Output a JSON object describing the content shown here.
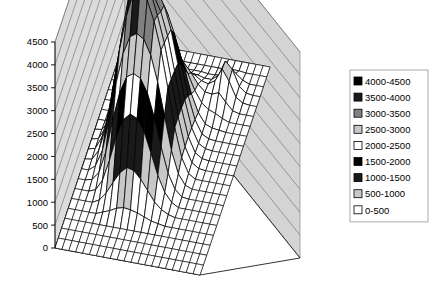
{
  "chart_data": {
    "type": "surface",
    "title": "",
    "xlabel": "",
    "ylabel": "",
    "zlabel": "",
    "zlim": [
      0,
      4500
    ],
    "ztick_labels": [
      "4500",
      "4000",
      "3500",
      "3000",
      "2500",
      "2000",
      "1500",
      "1000",
      "500",
      "0"
    ],
    "ztick_values": [
      4500,
      4000,
      3500,
      3000,
      2500,
      2000,
      1500,
      1000,
      500,
      0
    ],
    "grid": true,
    "legend_position": "right",
    "band_size": 500,
    "legend": [
      {
        "label": "4000-4500",
        "color": "#000000",
        "range": [
          4000,
          4500
        ]
      },
      {
        "label": "3500-4000",
        "color": "#1a1a1a",
        "range": [
          3500,
          4000
        ]
      },
      {
        "label": "3000-3500",
        "color": "#808080",
        "range": [
          3000,
          3500
        ]
      },
      {
        "label": "2500-3000",
        "color": "#c8c8c8",
        "range": [
          2500,
          3000
        ]
      },
      {
        "label": "2000-2500",
        "color": "#ffffff",
        "range": [
          2000,
          2500
        ]
      },
      {
        "label": "1500-2000",
        "color": "#000000",
        "range": [
          1500,
          2000
        ]
      },
      {
        "label": "1000-1500",
        "color": "#1a1a1a",
        "range": [
          1000,
          1500
        ]
      },
      {
        "label": "500-1000",
        "color": "#c8c8c8",
        "range": [
          500,
          1000
        ]
      },
      {
        "label": "0-500",
        "color": "#ffffff",
        "range": [
          0,
          500
        ]
      }
    ],
    "nx": 22,
    "ny": 22,
    "z": [
      [
        0,
        0,
        0,
        0,
        0,
        0,
        0,
        0,
        0,
        0,
        0,
        0,
        0,
        0,
        0,
        0,
        0,
        0,
        0,
        0,
        0,
        0
      ],
      [
        0,
        0,
        0,
        0,
        0,
        0,
        0,
        0,
        0,
        0,
        0,
        0,
        0,
        0,
        0,
        0,
        0,
        0,
        0,
        0,
        0,
        0
      ],
      [
        0,
        0,
        0,
        0,
        0,
        0,
        0,
        0,
        0,
        0,
        0,
        0,
        0,
        0,
        0,
        0,
        0,
        0,
        0,
        0,
        0,
        0
      ],
      [
        0,
        0,
        0,
        0,
        0,
        0,
        0,
        0,
        0,
        0,
        0,
        0,
        0,
        0,
        0,
        0,
        0,
        0,
        0,
        0,
        0,
        0
      ],
      [
        0,
        0,
        0,
        0,
        0,
        60,
        120,
        200,
        240,
        220,
        180,
        120,
        60,
        30,
        0,
        0,
        0,
        0,
        0,
        0,
        0,
        0
      ],
      [
        0,
        0,
        0,
        0,
        80,
        260,
        520,
        760,
        900,
        860,
        700,
        480,
        260,
        120,
        40,
        0,
        0,
        0,
        0,
        0,
        0,
        0
      ],
      [
        0,
        0,
        0,
        60,
        300,
        760,
        1300,
        1700,
        1850,
        1780,
        1520,
        1080,
        620,
        280,
        90,
        0,
        0,
        0,
        0,
        0,
        0,
        0
      ],
      [
        0,
        0,
        40,
        220,
        700,
        1420,
        2050,
        2420,
        2520,
        2440,
        2150,
        1640,
        1020,
        480,
        160,
        20,
        0,
        0,
        0,
        0,
        0,
        0
      ],
      [
        0,
        0,
        120,
        480,
        1180,
        2020,
        2680,
        3080,
        3180,
        3080,
        2760,
        2200,
        1480,
        760,
        280,
        60,
        0,
        0,
        0,
        0,
        0,
        0
      ],
      [
        0,
        20,
        240,
        760,
        1620,
        2520,
        3280,
        3820,
        3980,
        3720,
        3280,
        2680,
        1880,
        1040,
        420,
        100,
        0,
        0,
        0,
        0,
        0,
        0
      ],
      [
        0,
        40,
        320,
        900,
        1820,
        2760,
        3620,
        4320,
        4180,
        3680,
        3200,
        2620,
        1860,
        1060,
        440,
        120,
        20,
        0,
        0,
        0,
        0,
        0
      ],
      [
        0,
        40,
        300,
        860,
        1760,
        2640,
        3400,
        3780,
        3640,
        3380,
        3060,
        2560,
        1820,
        1040,
        440,
        120,
        20,
        0,
        0,
        0,
        0,
        0
      ],
      [
        0,
        20,
        220,
        680,
        1480,
        2280,
        2960,
        3320,
        3400,
        3280,
        2980,
        2480,
        1760,
        1000,
        420,
        110,
        20,
        0,
        0,
        0,
        0,
        0
      ],
      [
        0,
        0,
        120,
        440,
        1040,
        1760,
        2380,
        2760,
        2880,
        2820,
        2600,
        2180,
        1540,
        880,
        380,
        100,
        20,
        0,
        0,
        0,
        0,
        0
      ],
      [
        0,
        0,
        60,
        240,
        640,
        1180,
        1700,
        2060,
        2200,
        2180,
        2020,
        1700,
        1220,
        700,
        320,
        100,
        40,
        20,
        0,
        0,
        0,
        0
      ],
      [
        0,
        0,
        20,
        100,
        320,
        660,
        1040,
        1340,
        1480,
        1500,
        1420,
        1220,
        900,
        560,
        320,
        200,
        140,
        60,
        0,
        0,
        0,
        0
      ],
      [
        0,
        0,
        0,
        40,
        140,
        320,
        560,
        780,
        900,
        960,
        960,
        880,
        700,
        480,
        340,
        320,
        380,
        200,
        40,
        0,
        0,
        0
      ],
      [
        0,
        0,
        0,
        0,
        40,
        120,
        240,
        380,
        480,
        540,
        560,
        520,
        440,
        340,
        300,
        400,
        680,
        440,
        120,
        20,
        0,
        0
      ],
      [
        0,
        0,
        0,
        0,
        0,
        20,
        60,
        120,
        180,
        220,
        240,
        240,
        220,
        180,
        180,
        300,
        640,
        480,
        140,
        20,
        0,
        0
      ],
      [
        0,
        0,
        0,
        0,
        0,
        0,
        0,
        20,
        40,
        60,
        80,
        80,
        80,
        60,
        60,
        100,
        220,
        180,
        60,
        0,
        0,
        0
      ],
      [
        0,
        0,
        0,
        0,
        0,
        0,
        0,
        0,
        0,
        0,
        0,
        0,
        0,
        0,
        0,
        0,
        20,
        20,
        0,
        0,
        0,
        0
      ],
      [
        0,
        0,
        0,
        0,
        0,
        0,
        0,
        0,
        0,
        0,
        0,
        0,
        0,
        0,
        0,
        0,
        0,
        0,
        0,
        0,
        0,
        0
      ]
    ]
  },
  "style": {
    "wall_back_color": "#d4d4d4",
    "wall_left_color": "#dcdcdc",
    "floor_color": "#ffffff",
    "gridline_color": "#7a7a7a",
    "outline_color": "#000000",
    "legend_border_color": "#a0a0a0",
    "legend_bg_color": "#ffffff",
    "mesh_color": "#000000",
    "tick_color": "#000000",
    "background": "#ffffff"
  },
  "geometry": {
    "origin_x": 55,
    "origin_y": 248,
    "back_corner_x": 125,
    "back_corner_y": 18,
    "right_corner_x": 300,
    "right_corner_y": 258,
    "front_corner_x": 200,
    "front_corner_y": 275,
    "plot_top_y": 18,
    "z_height": 206
  }
}
